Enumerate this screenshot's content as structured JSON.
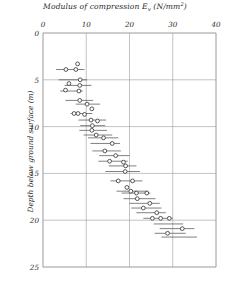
{
  "chart_data": {
    "type": "scatter",
    "title_main": "Modulus of compression",
    "title_symbol": "E",
    "title_sub": "v",
    "title_units_open": " (N/mm",
    "title_units_exp": "2",
    "title_units_close": ")",
    "xlabel": "Modulus of compression E_v (N/mm²)",
    "ylabel": "Depth below ground surface  (m)",
    "xlim": [
      0,
      40
    ],
    "ylim": [
      0,
      25
    ],
    "y_inverted": true,
    "xticks": [
      "0",
      "10",
      "20",
      "30",
      "40"
    ],
    "xtick_values": [
      0,
      10,
      20,
      30,
      40
    ],
    "yticks": [
      "0",
      "5",
      "10",
      "15",
      "20",
      "25"
    ],
    "ytick_values": [
      0,
      5,
      10,
      15,
      20,
      25
    ],
    "grid": true,
    "grid_color": "#9a9a9a",
    "marker": "open-circle",
    "marker_color": "#3a3a3a",
    "bar_color": "#4a4a4a",
    "legend": "none",
    "x_axis_position": "top",
    "points": [
      {
        "depth": 3.3,
        "value": 8.0
      },
      {
        "depth": 3.9,
        "value": 5.3
      },
      {
        "depth": 3.9,
        "value": 7.6
      },
      {
        "depth": 5.0,
        "value": 8.6
      },
      {
        "depth": 5.4,
        "value": 6.0
      },
      {
        "depth": 5.6,
        "value": 8.5
      },
      {
        "depth": 6.1,
        "value": 5.2
      },
      {
        "depth": 6.2,
        "value": 8.3
      },
      {
        "depth": 7.2,
        "value": 8.5
      },
      {
        "depth": 7.6,
        "value": 10.2
      },
      {
        "depth": 8.1,
        "value": 11.3
      },
      {
        "depth": 8.6,
        "value": 7.2
      },
      {
        "depth": 8.6,
        "value": 8.1
      },
      {
        "depth": 8.7,
        "value": 9.6
      },
      {
        "depth": 9.3,
        "value": 11.1
      },
      {
        "depth": 9.4,
        "value": 12.6
      },
      {
        "depth": 9.9,
        "value": 11.4
      },
      {
        "depth": 10.4,
        "value": 11.3
      },
      {
        "depth": 10.9,
        "value": 12.3
      },
      {
        "depth": 11.2,
        "value": 14.0
      },
      {
        "depth": 11.8,
        "value": 16.0
      },
      {
        "depth": 12.6,
        "value": 14.3
      },
      {
        "depth": 13.1,
        "value": 16.8
      },
      {
        "depth": 13.7,
        "value": 15.4
      },
      {
        "depth": 13.8,
        "value": 18.6
      },
      {
        "depth": 14.2,
        "value": 19.1
      },
      {
        "depth": 14.8,
        "value": 19.0
      },
      {
        "depth": 15.8,
        "value": 17.4
      },
      {
        "depth": 15.8,
        "value": 20.7
      },
      {
        "depth": 16.5,
        "value": 19.4
      },
      {
        "depth": 16.9,
        "value": 20.3
      },
      {
        "depth": 17.1,
        "value": 21.6
      },
      {
        "depth": 17.1,
        "value": 24.0
      },
      {
        "depth": 17.7,
        "value": 21.8
      },
      {
        "depth": 18.2,
        "value": 24.7
      },
      {
        "depth": 18.7,
        "value": 23.2
      },
      {
        "depth": 19.2,
        "value": 26.3
      },
      {
        "depth": 19.8,
        "value": 25.3
      },
      {
        "depth": 19.8,
        "value": 27.2
      },
      {
        "depth": 19.8,
        "value": 29.2
      },
      {
        "depth": 20.9,
        "value": 32.2
      },
      {
        "depth": 21.4,
        "value": 28.8
      }
    ],
    "ranges": [
      {
        "depth": 3.9,
        "low": 3.0,
        "high": 9.6
      },
      {
        "depth": 5.0,
        "low": 3.6,
        "high": 10.2
      },
      {
        "depth": 5.6,
        "low": 5.0,
        "high": 11.2
      },
      {
        "depth": 6.2,
        "low": 4.0,
        "high": 9.2
      },
      {
        "depth": 7.2,
        "low": 5.2,
        "high": 11.6
      },
      {
        "depth": 7.6,
        "low": 7.6,
        "high": 13.2
      },
      {
        "depth": 8.6,
        "low": 6.4,
        "high": 11.4
      },
      {
        "depth": 9.3,
        "low": 8.2,
        "high": 14.6
      },
      {
        "depth": 9.9,
        "low": 8.6,
        "high": 14.4
      },
      {
        "depth": 10.4,
        "low": 8.4,
        "high": 14.8
      },
      {
        "depth": 10.9,
        "low": 9.4,
        "high": 16.0
      },
      {
        "depth": 11.2,
        "low": 10.4,
        "high": 17.4
      },
      {
        "depth": 11.8,
        "low": 11.0,
        "high": 17.8
      },
      {
        "depth": 12.6,
        "low": 11.4,
        "high": 18.0
      },
      {
        "depth": 13.1,
        "low": 13.0,
        "high": 20.0
      },
      {
        "depth": 13.7,
        "low": 12.8,
        "high": 19.6
      },
      {
        "depth": 14.2,
        "low": 15.2,
        "high": 21.6
      },
      {
        "depth": 14.8,
        "low": 14.4,
        "high": 22.4
      },
      {
        "depth": 15.8,
        "low": 15.6,
        "high": 23.0
      },
      {
        "depth": 16.9,
        "low": 17.0,
        "high": 24.2
      },
      {
        "depth": 17.1,
        "low": 18.2,
        "high": 24.8
      },
      {
        "depth": 17.7,
        "low": 18.6,
        "high": 26.0
      },
      {
        "depth": 18.2,
        "low": 20.0,
        "high": 27.0
      },
      {
        "depth": 18.7,
        "low": 20.4,
        "high": 27.4
      },
      {
        "depth": 19.2,
        "low": 21.6,
        "high": 28.4
      },
      {
        "depth": 19.8,
        "low": 23.2,
        "high": 30.0
      },
      {
        "depth": 20.4,
        "low": 25.6,
        "high": 32.4
      },
      {
        "depth": 20.9,
        "low": 27.0,
        "high": 35.0
      },
      {
        "depth": 21.4,
        "low": 25.8,
        "high": 33.0
      },
      {
        "depth": 21.8,
        "low": 27.4,
        "high": 35.6
      }
    ]
  }
}
